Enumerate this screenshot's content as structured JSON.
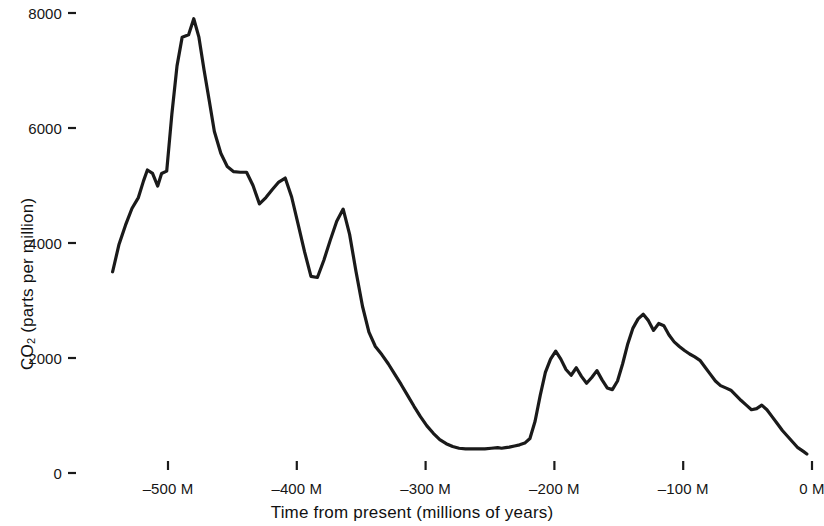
{
  "chart_data": {
    "type": "line",
    "title": "",
    "subtitle": "",
    "xlabel": "Time from present (millions of years)",
    "ylabel_parts": {
      "prefix": "CO",
      "sub": "2",
      "suffix": " (parts per million)"
    },
    "ylabel": "CO2 (parts per million)",
    "xlim": [
      -545,
      -1
    ],
    "ylim": [
      0,
      8350
    ],
    "grid": false,
    "legend": null,
    "x_ticks": [
      {
        "value": -500,
        "label": "–500 M"
      },
      {
        "value": -400,
        "label": "–400 M"
      },
      {
        "value": -300,
        "label": "–300 M"
      },
      {
        "value": -200,
        "label": "–200 M"
      },
      {
        "value": -100,
        "label": "–100 M"
      },
      {
        "value": 0,
        "label": "0 M"
      }
    ],
    "y_ticks": [
      {
        "value": 0,
        "label": "0"
      },
      {
        "value": 2000,
        "label": "2000"
      },
      {
        "value": 4000,
        "label": "4000"
      },
      {
        "value": 6000,
        "label": "6000"
      },
      {
        "value": 8000,
        "label": "8000"
      }
    ],
    "line_color": "#1a1a1a",
    "line_width": 3.2,
    "series": [
      {
        "name": "Atmospheric CO2",
        "x": [
          -543,
          -538,
          -533,
          -528,
          -523,
          -519,
          -516,
          -512,
          -508,
          -505,
          -501,
          -497,
          -493,
          -489,
          -484,
          -480,
          -476,
          -472,
          -468,
          -464,
          -459,
          -454,
          -449,
          -444,
          -439,
          -434,
          -429,
          -424,
          -419,
          -414,
          -409,
          -404,
          -399,
          -394,
          -389,
          -384,
          -379,
          -374,
          -369,
          -364,
          -359,
          -354,
          -349,
          -344,
          -339,
          -334,
          -329,
          -324,
          -319,
          -314,
          -309,
          -304,
          -299,
          -294,
          -289,
          -284,
          -279,
          -274,
          -269,
          -264,
          -259,
          -254,
          -249,
          -244,
          -241,
          -238,
          -235,
          -231,
          -227,
          -223,
          -219,
          -215,
          -211,
          -207,
          -203,
          -199,
          -195,
          -191,
          -187,
          -183,
          -179,
          -175,
          -171,
          -167,
          -163,
          -159,
          -155,
          -151,
          -147,
          -143,
          -139,
          -135,
          -131,
          -127,
          -123,
          -119,
          -115,
          -111,
          -107,
          -103,
          -99,
          -95,
          -91,
          -87,
          -83,
          -79,
          -75,
          -71,
          -67,
          -63,
          -59,
          -55,
          -51,
          -47,
          -43,
          -39,
          -35,
          -31,
          -27,
          -23,
          -19,
          -15,
          -11,
          -7,
          -4
        ],
        "y": [
          3500,
          3980,
          4310,
          4600,
          4790,
          5080,
          5270,
          5210,
          4990,
          5210,
          5250,
          6240,
          7080,
          7580,
          7620,
          7900,
          7580,
          7010,
          6480,
          5940,
          5560,
          5330,
          5240,
          5230,
          5230,
          5000,
          4680,
          4790,
          4930,
          5060,
          5130,
          4800,
          4330,
          3850,
          3420,
          3400,
          3700,
          4050,
          4380,
          4590,
          4150,
          3500,
          2900,
          2450,
          2200,
          2060,
          1900,
          1720,
          1540,
          1350,
          1160,
          980,
          820,
          690,
          580,
          510,
          460,
          430,
          420,
          420,
          420,
          420,
          430,
          440,
          430,
          440,
          450,
          470,
          490,
          520,
          600,
          900,
          1350,
          1750,
          1980,
          2120,
          1980,
          1800,
          1700,
          1830,
          1680,
          1560,
          1660,
          1780,
          1620,
          1480,
          1450,
          1600,
          1900,
          2250,
          2520,
          2680,
          2760,
          2650,
          2480,
          2600,
          2560,
          2400,
          2280,
          2200,
          2130,
          2070,
          2020,
          1960,
          1840,
          1720,
          1600,
          1520,
          1480,
          1440,
          1350,
          1260,
          1180,
          1100,
          1120,
          1180,
          1100,
          980,
          860,
          740,
          640,
          540,
          440,
          380,
          330
        ]
      }
    ]
  },
  "axes": {
    "tick_mark_color": "#1a1a1a"
  }
}
